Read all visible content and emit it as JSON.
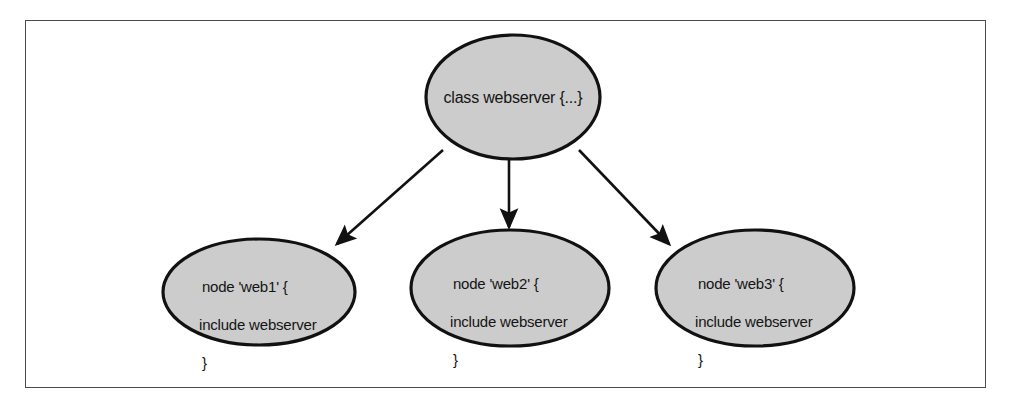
{
  "figure": {
    "type": "directed-graph",
    "border_color": "#4a4a4a",
    "background": "#ffffff",
    "node_fill": "#cccccc",
    "node_stroke": "#111111",
    "edge_color": "#111111"
  },
  "nodes": {
    "root": {
      "id": "class-webserver",
      "label": "class webserver {...}",
      "cx": 513,
      "cy": 97,
      "rx": 87,
      "ry": 62
    },
    "children": [
      {
        "id": "node-web1",
        "line1": "node 'web1' {",
        "line2": "include webserver",
        "line3": "}",
        "cx": 259,
        "cy": 292,
        "rx": 96,
        "ry": 53
      },
      {
        "id": "node-web2",
        "line1": "node 'web2' {",
        "line2": "include webserver",
        "line3": "}",
        "cx": 510,
        "cy": 288,
        "rx": 99,
        "ry": 58
      },
      {
        "id": "node-web3",
        "line1": "node 'web3' {",
        "line2": "include webserver",
        "line3": "}",
        "cx": 755,
        "cy": 288,
        "rx": 99,
        "ry": 58
      }
    ]
  },
  "edges": [
    {
      "id": "edge-root-web1",
      "from": "class-webserver",
      "to": "node-web1",
      "x1": 443,
      "y1": 150,
      "x2": 337,
      "y2": 244
    },
    {
      "id": "edge-root-web2",
      "from": "class-webserver",
      "to": "node-web2",
      "x1": 509,
      "y1": 160,
      "x2": 509,
      "y2": 227
    },
    {
      "id": "edge-root-web3",
      "from": "class-webserver",
      "to": "node-web3",
      "x1": 579,
      "y1": 150,
      "x2": 669,
      "y2": 244
    }
  ]
}
